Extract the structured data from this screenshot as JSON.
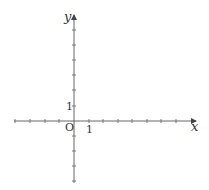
{
  "diagram": {
    "type": "coordinate-plane",
    "axes": {
      "x_label": "x",
      "y_label": "y",
      "origin_label": "O",
      "x_unit_label": "1",
      "y_unit_label": "1",
      "x_ticks": [
        -4,
        -3,
        -2,
        -1,
        1,
        2,
        3,
        4,
        5,
        6,
        7,
        8
      ],
      "y_ticks": [
        -4,
        -3,
        -2,
        -1,
        1,
        2,
        3,
        4,
        5,
        6,
        7
      ],
      "color": "#555555"
    }
  }
}
